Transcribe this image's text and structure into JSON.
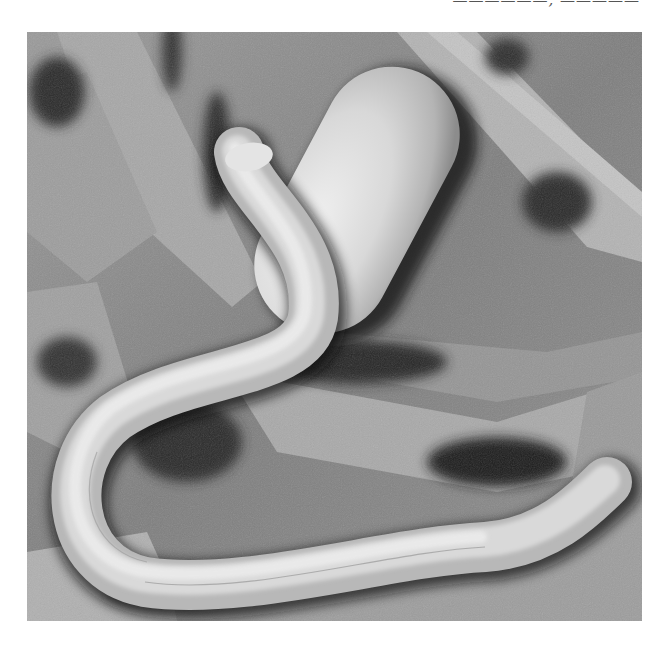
{
  "caption": {
    "text_visible": "(clipped caption — only lower edge of glyphs visible, illegible)",
    "style": "italic, partially cut off at top edge"
  },
  "photo": {
    "kind": "scanning electron micrograph (grayscale)",
    "subjects": [
      "nematode-worm",
      "nematode-egg",
      "fibrous-substrate"
    ],
    "colors": {
      "background_gray": "#8a8a8a",
      "shadow": "#1e1e1e",
      "worm_highlight": "#e6e6e6",
      "egg_highlight": "#eaeaea",
      "substrate_light": "#b5b5b5"
    }
  }
}
